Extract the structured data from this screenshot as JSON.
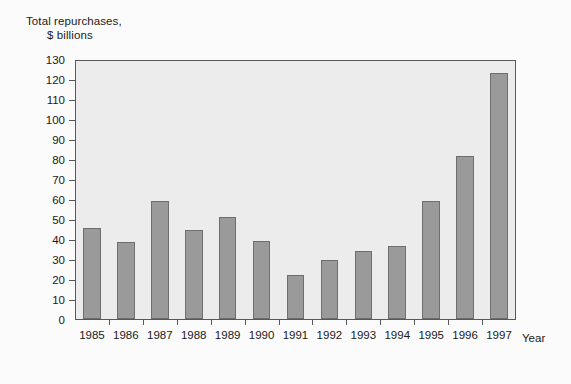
{
  "chart_data": {
    "type": "bar",
    "title": "",
    "ylabel_line1": "Total repurchases,",
    "ylabel_line2": "$ billions",
    "xlabel": "Year",
    "categories": [
      "1985",
      "1986",
      "1987",
      "1988",
      "1989",
      "1990",
      "1991",
      "1992",
      "1993",
      "1994",
      "1995",
      "1996",
      "1997"
    ],
    "values": [
      45.5,
      38.5,
      59,
      44.5,
      51,
      39,
      22,
      29.5,
      34,
      36.5,
      59,
      81.5,
      123
    ],
    "ylim": [
      0,
      130
    ],
    "ytick_step": 10,
    "ytick_labels": [
      "130",
      "120",
      "110",
      "100",
      "90",
      "80",
      "70",
      "60",
      "50",
      "40",
      "30",
      "20",
      "10",
      "0"
    ],
    "grid": false,
    "legend": "none",
    "bar_color": "#9a9a9a",
    "bar_edge_color": "#6e6e70",
    "plot_background": "#ececec",
    "frame_color": "#58585a",
    "figure_background": "#fbfbfb"
  }
}
